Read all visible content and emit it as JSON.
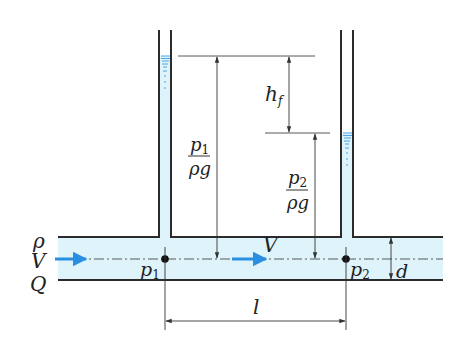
{
  "figure": {
    "type": "pipe-friction-head-loss-diagram",
    "colors": {
      "water": "#dff3fb",
      "flow_arrow": "#2a8fe0",
      "meniscus": "#4aa6e6",
      "wall": "#2b2b2b",
      "dimension": "#333333"
    },
    "inlet_labels": {
      "density": "ρ",
      "velocity": "V",
      "flow_rate": "Q"
    },
    "pipe": {
      "velocity_label": "V",
      "diameter_label": "d",
      "length_label": "l"
    },
    "points": {
      "p1": {
        "base": "p",
        "sub": "1"
      },
      "p2": {
        "base": "p",
        "sub": "2"
      }
    },
    "heads": {
      "head1": {
        "num_base": "p",
        "num_sub": "1",
        "den": "ρg"
      },
      "head2": {
        "num_base": "p",
        "num_sub": "2",
        "den": "ρg"
      },
      "loss": {
        "base": "h",
        "sub": "f"
      }
    }
  }
}
